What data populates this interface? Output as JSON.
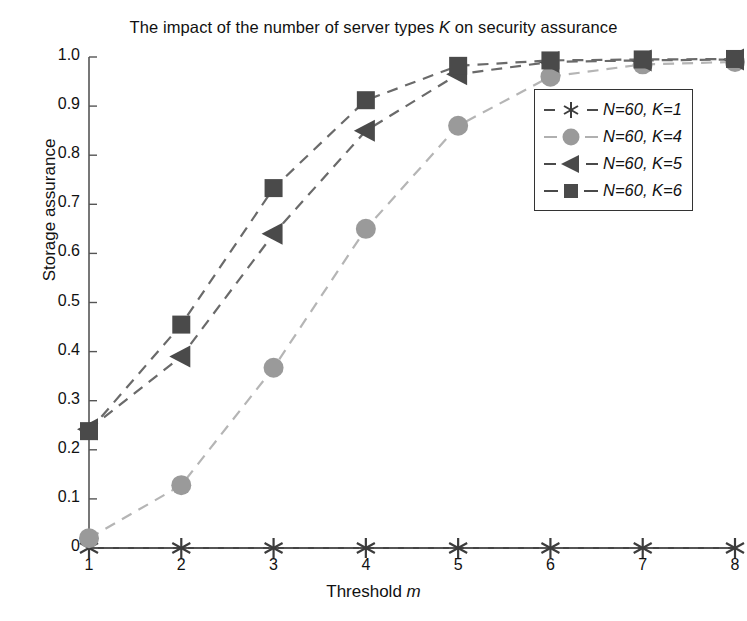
{
  "chart_data": {
    "type": "line",
    "title": "The impact of the number of server types K on security assurance",
    "title_plain": "The impact of the number of server types K on security assurance",
    "xlabel": "Threshold m",
    "ylabel": "Storage assurance",
    "x": [
      1,
      2,
      3,
      4,
      5,
      6,
      7,
      8
    ],
    "xtick_labels": [
      "1",
      "2",
      "3",
      "4",
      "5",
      "6",
      "7",
      "8"
    ],
    "ytick_labels": [
      "0",
      "0.1",
      "0.2",
      "0.3",
      "0.4",
      "0.5",
      "0.6",
      "0.7",
      "0.8",
      "0.9",
      "1.0"
    ],
    "xlim": [
      1,
      8
    ],
    "ylim": [
      0,
      1.0
    ],
    "grid": false,
    "legend_position": "upper right",
    "linestyle": "dashed",
    "series": [
      {
        "name": "N=60, K=1",
        "legend_label": "N=60, K=1",
        "marker": "asterisk",
        "color": "#3c3c3c",
        "values": [
          0,
          0,
          0,
          0,
          0,
          0,
          0,
          0
        ]
      },
      {
        "name": "N=60, K=4",
        "legend_label": "N=60, K=4",
        "marker": "circle",
        "color": "#9a9a9a",
        "values": [
          0.02,
          0.128,
          0.367,
          0.65,
          0.86,
          0.96,
          0.985,
          0.99
        ]
      },
      {
        "name": "N=60, K=5",
        "legend_label": "N=60, K=5",
        "marker": "left-triangle",
        "color": "#4a4a4a",
        "values": [
          0.242,
          0.39,
          0.64,
          0.85,
          0.965,
          0.99,
          0.993,
          0.995
        ]
      },
      {
        "name": "N=60, K=6",
        "legend_label": "N=60, K=6",
        "marker": "square",
        "color": "#4a4a4a",
        "values": [
          0.238,
          0.455,
          0.733,
          0.912,
          0.982,
          0.993,
          0.995,
          0.996
        ]
      }
    ]
  },
  "axes": {
    "y_ticks": [
      "1.0",
      "0.9",
      "0.8",
      "0.7",
      "0.6",
      "0.5",
      "0.4",
      "0.3",
      "0.2",
      "0.1",
      "0"
    ],
    "x_ticks": [
      "1",
      "2",
      "3",
      "4",
      "5",
      "6",
      "7",
      "8"
    ]
  },
  "legend": {
    "entries": [
      {
        "label": "N=60, K=1"
      },
      {
        "label": "N=60, K=4"
      },
      {
        "label": "N=60, K=5"
      },
      {
        "label": "N=60, K=6"
      }
    ]
  }
}
